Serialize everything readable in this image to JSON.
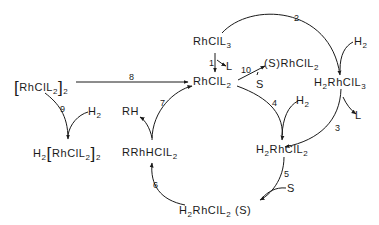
{
  "diagram": {
    "species": {
      "rhcll3": {
        "base": "RhClL",
        "sub": "3"
      },
      "h2rhcll3": {
        "pre": "H",
        "presub": "2",
        "base": "RhClL",
        "sub": "3"
      },
      "rhcll2": {
        "base": "RhClL",
        "sub": "2"
      },
      "srhcll2": {
        "base": "(S)RhClL",
        "sub": "2"
      },
      "h2rhcll2": {
        "pre": "H",
        "presub": "2",
        "base": "RhClL",
        "sub": "2"
      },
      "h2rhcll2s": {
        "pre": "H",
        "presub": "2",
        "base": "RhClL",
        "sub": "2",
        "post": " (S)"
      },
      "rrhhcll2": {
        "base": "RRhHClL",
        "sub": "2"
      },
      "dimer": {
        "open": "[",
        "base": "RhClL",
        "sub": "2",
        "close": "]",
        "outer": "2"
      },
      "h2dimer": {
        "pre": "H",
        "presub": "2",
        "open": "[",
        "base": "RhClL",
        "sub": "2",
        "close": "]",
        "outer": "2"
      }
    },
    "reagents": {
      "L_1": "L",
      "L_3": "L",
      "H2_2": "H",
      "H2_4": "H",
      "H2_9": "H",
      "h2sub": "2",
      "S_5": "S",
      "S_10": "S",
      "RH": "RH"
    },
    "steps": [
      "1",
      "2",
      "3",
      "4",
      "5",
      "6",
      "7",
      "8",
      "9",
      "10"
    ]
  }
}
